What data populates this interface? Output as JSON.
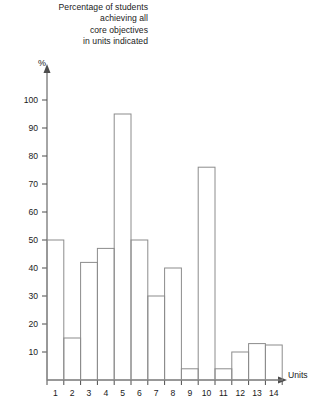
{
  "title": {
    "lines": [
      "Percentage of students",
      "achieving all",
      "core objectives",
      "in units indicated"
    ]
  },
  "axes": {
    "y_axis_label": "%",
    "x_axis_label": "Units",
    "y_ticks": [
      "10",
      "20",
      "30",
      "40",
      "50",
      "60",
      "70",
      "80",
      "90",
      "100"
    ],
    "x_ticks": [
      "1",
      "2",
      "3",
      "4",
      "5",
      "6",
      "7",
      "8",
      "9",
      "10",
      "11",
      "12",
      "13",
      "14"
    ]
  },
  "colors": {
    "bar_stroke": "#8c8c8c",
    "axis": "#4d4d4d",
    "background": "#ffffff",
    "text": "#1a1a1a"
  },
  "chart_data": {
    "type": "bar",
    "title": "Percentage of students achieving all core objectives in units indicated",
    "xlabel": "Units",
    "ylabel": "%",
    "categories": [
      "1",
      "2",
      "3",
      "4",
      "5",
      "6",
      "7",
      "8",
      "9",
      "10",
      "11",
      "12",
      "13",
      "14"
    ],
    "values": [
      50,
      15,
      42,
      47,
      95,
      50,
      30,
      40,
      4,
      76,
      4,
      10,
      13,
      12.5
    ],
    "ylim": [
      0,
      100
    ],
    "ytick_step": 10,
    "grid": false,
    "legend": false
  }
}
